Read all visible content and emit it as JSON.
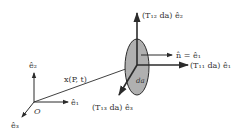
{
  "diagram": {
    "type": "traction-vector-components",
    "colors": {
      "ink": "#2b2b2b",
      "surface_fill": "#b0b0b0",
      "background": "#ffffff"
    },
    "origin_label": "O",
    "basis": {
      "e1": "ê₁",
      "e2": "ê₂",
      "e3": "ê₃"
    },
    "position_vector_label": "x(P, t)",
    "area_element_label": "da",
    "normal_label": "n̂ = ê₁",
    "traction_components": {
      "T11": "(T₁₁ da) ê₁",
      "T12": "(T₁₂ da) ê₂",
      "T13": "(T₁₃ da) ê₃"
    }
  }
}
